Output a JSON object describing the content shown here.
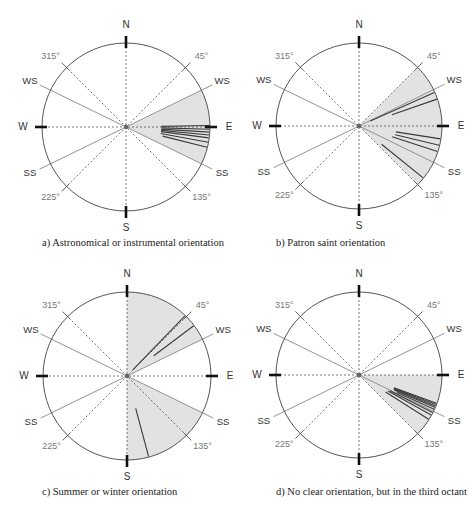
{
  "figure": {
    "panels": [
      {
        "id": "a",
        "caption": "a) Astronomical or instrumental orientation",
        "center": [
          126,
          127
        ],
        "radius": 84,
        "caption_pos": [
          42,
          244
        ],
        "shaded_sectors": [
          [
            64,
            116
          ]
        ],
        "orientation_lines": [
          {
            "az": 89,
            "r0": 0.42
          },
          {
            "az": 91.5,
            "r0": 0.42
          },
          {
            "az": 93.5,
            "r0": 0.42
          },
          {
            "az": 95.5,
            "r0": 0.42
          },
          {
            "az": 97.5,
            "r0": 0.42
          },
          {
            "az": 100.5,
            "r0": 0.42
          },
          {
            "az": 104,
            "r0": 0.45
          }
        ]
      },
      {
        "id": "b",
        "caption": "b) Patron saint orientation",
        "center": [
          359,
          126
        ],
        "radius": 83,
        "caption_pos": [
          276,
          244
        ],
        "shaded_sectors": [
          [
            45,
            135
          ]
        ],
        "orientation_lines": [
          {
            "az": 66,
            "r0": 0.15
          },
          {
            "az": 71,
            "r0": 0.42
          },
          {
            "az": 99,
            "r0": 0.45
          },
          {
            "az": 103.5,
            "r0": 0.45
          },
          {
            "az": 108,
            "r0": 0.42
          },
          {
            "az": 129,
            "r0": 0.35
          }
        ]
      },
      {
        "id": "c",
        "caption": "c) Summer or winter orientation",
        "center": [
          127,
          376
        ],
        "radius": 84,
        "caption_pos": [
          42,
          493
        ],
        "shaded_sectors": [
          [
            0,
            64
          ],
          [
            116,
            180
          ]
        ],
        "orientation_lines": [
          {
            "az": 44,
            "r0": 0.1
          },
          {
            "az": 53,
            "r0": 0.4
          },
          {
            "az": 165,
            "r0": 0.4
          }
        ]
      },
      {
        "id": "d",
        "caption": "d) No clear orientation, but in the third octant",
        "center": [
          359,
          375
        ],
        "radius": 83,
        "caption_pos": [
          276,
          493
        ],
        "shaded_sectors": [
          [
            90,
            135
          ]
        ],
        "orientation_lines": [
          {
            "az": 110,
            "r0": 0.45
          },
          {
            "az": 111,
            "r0": 0.45
          },
          {
            "az": 112,
            "r0": 0.45
          },
          {
            "az": 113,
            "r0": 0.46
          },
          {
            "az": 114.5,
            "r0": 0.5
          },
          {
            "az": 117,
            "r0": 0.42
          },
          {
            "az": 119,
            "r0": 0.4
          },
          {
            "az": 122.5,
            "r0": 0.38
          }
        ]
      }
    ],
    "cardinal_labels": {
      "N": "N",
      "E": "E",
      "S": "S",
      "W": "W"
    },
    "intercardinal_labels": {
      "45": "45°",
      "135": "135°",
      "225": "225°",
      "315": "315°"
    },
    "solstice_labels": {
      "winter": "WS",
      "summer": "SS"
    },
    "solstice_azimuths": {
      "ws_east": 64,
      "ss_east": 116,
      "ws_west": 296,
      "ss_west": 244
    },
    "colors": {
      "circle": "#555555",
      "shade": "#e2e2e2",
      "dashed": "#555555",
      "solstice_line": "#888888",
      "orientation_line": "#3a3a3a",
      "cardinal_tick": "#111111",
      "label": "#333333",
      "degree_label": "#777777"
    }
  }
}
